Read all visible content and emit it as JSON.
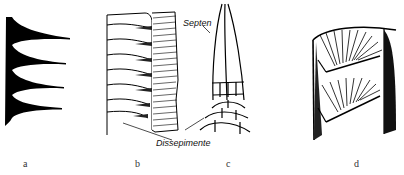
{
  "figure": {
    "panels": [
      {
        "id": "a",
        "label": "a"
      },
      {
        "id": "b",
        "label": "b"
      },
      {
        "id": "c",
        "label": "c"
      },
      {
        "id": "d",
        "label": "d"
      }
    ],
    "annotations": {
      "septen": "Septen",
      "dissepimente": "Dissepimente"
    }
  }
}
